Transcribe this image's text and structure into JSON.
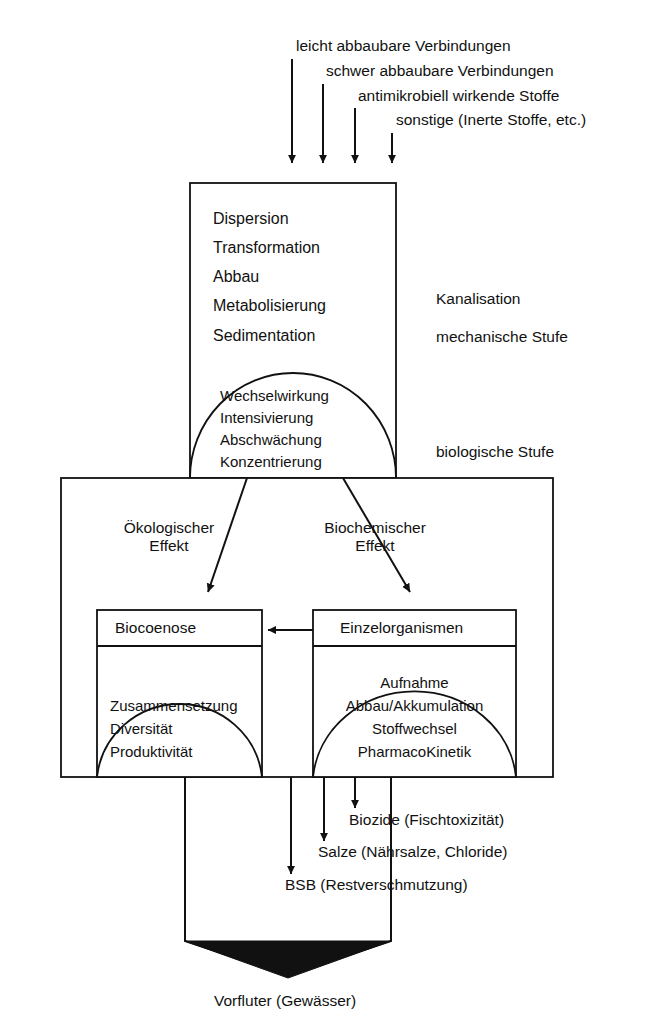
{
  "diagram": {
    "inflows": [
      {
        "label": "leicht abbaubare Verbindungen"
      },
      {
        "label": "schwer abbaubare Verbindungen"
      },
      {
        "label": "antimikrobiell wirkende Stoffe"
      },
      {
        "label": "sonstige (Inerte Stoffe, etc.)"
      }
    ],
    "upper_box": {
      "processes": [
        {
          "label": "Dispersion"
        },
        {
          "label": "Transformation"
        },
        {
          "label": "Abbau"
        },
        {
          "label": "Metabolisierung"
        },
        {
          "label": "Sedimentation"
        }
      ],
      "dome_items": [
        {
          "label": "Wechselwirkung"
        },
        {
          "label": "Intensivierung"
        },
        {
          "label": "Abschwächung"
        },
        {
          "label": "Konzentrierung"
        }
      ]
    },
    "stage_labels": [
      {
        "label": "Kanalisation"
      },
      {
        "label": "mechanische Stufe"
      },
      {
        "label": "biologische Stufe"
      }
    ],
    "effects": [
      {
        "line1": "Ökologischer",
        "line2": "Effekt"
      },
      {
        "line1": "Biochemischer",
        "line2": "Effekt"
      }
    ],
    "inner_boxes": [
      {
        "title": "Biocoenose",
        "dome_items": [
          {
            "label": "Zusammensetzung"
          },
          {
            "label": "Diversität"
          },
          {
            "label": "Produktivität"
          }
        ]
      },
      {
        "title": "Einzelorganismen",
        "dome_items": [
          {
            "label": "Aufnahme"
          },
          {
            "label": "Abbau/Akkumulation"
          },
          {
            "label": "Stoffwechsel"
          },
          {
            "label": "PharmacoKinetik"
          }
        ]
      }
    ],
    "outflows": [
      {
        "label": "Biozide (Fischtoxizität)"
      },
      {
        "label": "Salze (Nährsalze, Chloride)"
      },
      {
        "label": "BSB (Restverschmutzung)"
      }
    ],
    "outlet": {
      "label": "Vorfluter (Gewässer)"
    },
    "colors": {
      "line": "#111111",
      "fill": "#ffffff",
      "arrow": "#111111",
      "background": "#ffffff"
    }
  }
}
